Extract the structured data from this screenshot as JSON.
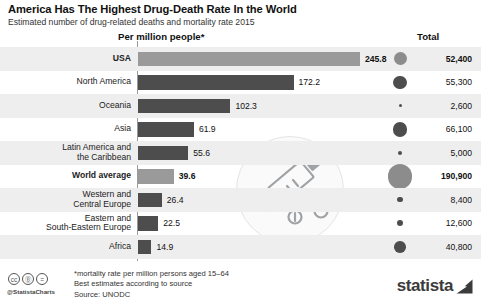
{
  "header": {
    "title": "America Has The Highest Drug-Death Rate In the World",
    "subtitle": "Estimated number of drug-related deaths and mortality rate 2015"
  },
  "columns": {
    "bars_header": "Per million people*",
    "total_header": "Total"
  },
  "footer": {
    "note1": "*mortality rate per million persons aged 15–64",
    "note2": "Best estimates according to source",
    "source": "Source: UNODC",
    "handle": "@StatistaCharts",
    "cc_label": "cc",
    "cc_by": "Ⓑ",
    "cc_nd": "=",
    "brand": "statista"
  },
  "chart_data": {
    "type": "bar",
    "title": "America Has The Highest Drug-Death Rate In the World",
    "subtitle": "Estimated number of drug-related deaths and mortality rate 2015",
    "xlabel": "Per million people*",
    "ylabel": "",
    "grid": false,
    "legend": "none",
    "xlim": [
      0,
      245.8
    ],
    "value_axis_unit": "deaths per million people aged 15-64",
    "secondary_series_name": "Total drug-related deaths",
    "categories": [
      "USA",
      "North America",
      "Oceania",
      "Asia",
      "Latin America and the Caribbean",
      "World average",
      "Western and Central Europe",
      "Eastern and South-Eastern Europe",
      "Africa"
    ],
    "values": [
      245.8,
      172.2,
      102.3,
      61.9,
      55.6,
      39.6,
      26.4,
      22.5,
      14.9
    ],
    "totals": [
      52400,
      55300,
      2600,
      66100,
      5000,
      190900,
      8400,
      12600,
      40800
    ],
    "rows": [
      {
        "label_lines": [
          "USA"
        ],
        "highlight": true,
        "value": 245.8,
        "value_text": "245.8",
        "total": 52400,
        "total_text": "52,400",
        "bubble_px": 13
      },
      {
        "label_lines": [
          "North America"
        ],
        "highlight": false,
        "value": 172.2,
        "value_text": "172.2",
        "total": 55300,
        "total_text": "55,300",
        "bubble_px": 13.4
      },
      {
        "label_lines": [
          "Oceania"
        ],
        "highlight": false,
        "value": 102.3,
        "value_text": "102.3",
        "total": 2600,
        "total_text": "2,600",
        "bubble_px": 3
      },
      {
        "label_lines": [
          "Asia"
        ],
        "highlight": false,
        "value": 61.9,
        "value_text": "61.9",
        "total": 66100,
        "total_text": "66,100",
        "bubble_px": 14.6
      },
      {
        "label_lines": [
          "Latin America and",
          "the Caribbean"
        ],
        "highlight": false,
        "value": 55.6,
        "value_text": "55.6",
        "total": 5000,
        "total_text": "5,000",
        "bubble_px": 4.2
      },
      {
        "label_lines": [
          "World average"
        ],
        "highlight": true,
        "value": 39.6,
        "value_text": "39.6",
        "total": 190900,
        "total_text": "190,900",
        "bubble_px": 24.8
      },
      {
        "label_lines": [
          "Western and",
          "Central Europe"
        ],
        "highlight": false,
        "value": 26.4,
        "value_text": "26.4",
        "total": 8400,
        "total_text": "8,400",
        "bubble_px": 5.4
      },
      {
        "label_lines": [
          "Eastern and",
          "South-Eastern Europe"
        ],
        "highlight": false,
        "value": 22.5,
        "value_text": "22.5",
        "total": 12600,
        "total_text": "12,600",
        "bubble_px": 6.4
      },
      {
        "label_lines": [
          "Africa"
        ],
        "highlight": false,
        "value": 14.9,
        "value_text": "14.9",
        "total": 40800,
        "total_text": "40,800",
        "bubble_px": 11.6
      }
    ]
  },
  "colors": {
    "bar_dark": "#4d4d4d",
    "bar_light": "#9a9a9a",
    "band": "#eeeeee",
    "text": "#111111",
    "brand": "#3b3b3b"
  },
  "illustration": {
    "name": "syringe-and-pills-illustration"
  }
}
